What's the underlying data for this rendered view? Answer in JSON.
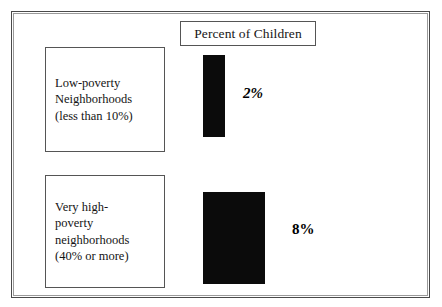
{
  "figure": {
    "title": "Percent of Children",
    "background_color": "#ffffff",
    "frame_color": "#4a4a4a",
    "bar_color": "#0b0b0b"
  },
  "chart_data": {
    "type": "bar",
    "title": "Percent of Children",
    "orientation": "vertical",
    "xlabel": "",
    "ylabel": "Percent of Children",
    "grid": false,
    "legend": "none",
    "categories": [
      "Low-poverty Neighborhoods (less than 10%)",
      "Very high-poverty neighborhoods (40% or more)"
    ],
    "values": [
      2,
      8
    ],
    "value_labels": [
      "2%",
      "8%"
    ],
    "value_unit": "%",
    "ylim": [
      0,
      8
    ]
  },
  "categories": [
    {
      "id": "low-poverty",
      "lines": [
        "Low-poverty",
        "Neighborhoods",
        "(less than 10%)"
      ],
      "value_label": "2%"
    },
    {
      "id": "very-high-poverty",
      "lines": [
        "Very high-",
        "poverty",
        "neighborhoods",
        "(40% or more)"
      ],
      "value_label": "8%"
    }
  ]
}
